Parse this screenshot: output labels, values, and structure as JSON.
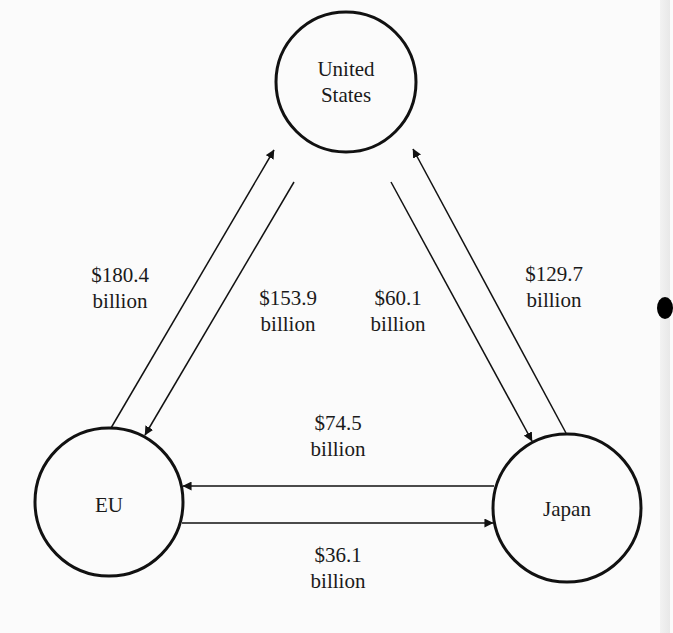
{
  "diagram": {
    "type": "trade-flow",
    "nodes": [
      {
        "id": "us",
        "label_line1": "United",
        "label_line2": "States"
      },
      {
        "id": "eu",
        "label": "EU"
      },
      {
        "id": "japan",
        "label": "Japan"
      }
    ],
    "flows": [
      {
        "from": "eu",
        "to": "us",
        "amount": "$180.4",
        "unit": "billion"
      },
      {
        "from": "us",
        "to": "eu",
        "amount": "$153.9",
        "unit": "billion"
      },
      {
        "from": "us",
        "to": "japan",
        "amount": "$60.1",
        "unit": "billion"
      },
      {
        "from": "japan",
        "to": "us",
        "amount": "$129.7",
        "unit": "billion"
      },
      {
        "from": "japan",
        "to": "eu",
        "amount": "$74.5",
        "unit": "billion"
      },
      {
        "from": "eu",
        "to": "japan",
        "amount": "$36.1",
        "unit": "billion"
      }
    ],
    "colors": {
      "stroke": "#111111",
      "text": "#1a1a1a",
      "background": "#fbfbfb"
    }
  }
}
